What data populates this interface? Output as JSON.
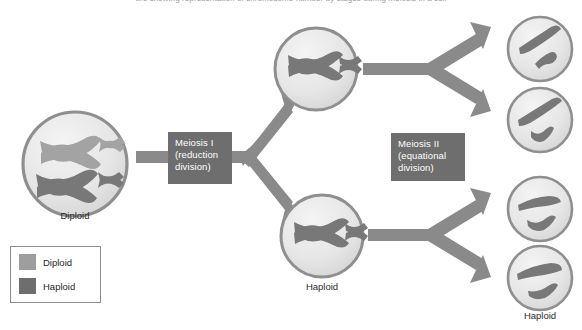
{
  "page": {
    "top_caption": "ure   showing representation of  chromosome  number  by  stages  during  meiosis in  a  cell",
    "width": 582,
    "height": 330
  },
  "colors": {
    "diploid_swatch": "#9e9e9e",
    "haploid_swatch": "#6e6e6e",
    "cell_membrane": "#8f8f8f",
    "cell_fill": "#e8e8e8",
    "chromosome_light": "#a3a3a3",
    "chromosome_dark": "#787878",
    "arrow": "#8a8a8a",
    "process_box": "#6e6e6e",
    "process_text": "#ffffff",
    "label_text": "#2b2b2b",
    "legend_border": "#8c8c8c"
  },
  "process_steps": [
    {
      "name": "meiosis-1",
      "line1": "Meiosis I",
      "line2": "(reduction",
      "line3": "division)"
    },
    {
      "name": "meiosis-2",
      "line1": "Meiosis II",
      "line2": "(equational",
      "line3": "division)"
    }
  ],
  "cells": [
    {
      "id": "parent-cell",
      "label": "Diploid",
      "ploidy": "diploid",
      "chromosomes": 4
    },
    {
      "id": "daughter-cell-top",
      "label": "",
      "ploidy": "haploid",
      "chromosomes": 2
    },
    {
      "id": "daughter-cell-bottom",
      "label": "Haploid",
      "ploidy": "haploid",
      "chromosomes": 2
    },
    {
      "id": "gamete-1",
      "label": "",
      "ploidy": "haploid",
      "chromosomes": 2
    },
    {
      "id": "gamete-2",
      "label": "",
      "ploidy": "haploid",
      "chromosomes": 2
    },
    {
      "id": "gamete-3",
      "label": "",
      "ploidy": "haploid",
      "chromosomes": 2
    },
    {
      "id": "gamete-4",
      "label": "Haploid",
      "ploidy": "haploid",
      "chromosomes": 2
    }
  ],
  "legend": {
    "items": [
      {
        "label": "Diploid",
        "color": "#9e9e9e"
      },
      {
        "label": "Haploid",
        "color": "#6e6e6e"
      }
    ]
  }
}
